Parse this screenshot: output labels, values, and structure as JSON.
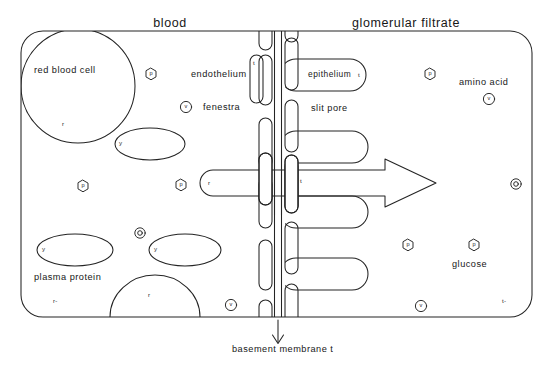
{
  "figure": {
    "type": "biological-diagram",
    "background_color": "#ffffff",
    "line_color": "#222222"
  },
  "titles": {
    "left": "blood",
    "right": "glomerular  filtrate"
  },
  "annotations": {
    "red_blood_cell": "red  blood  cell",
    "endothelium": "endothelium",
    "fenestra": "fenestra",
    "epithelium": "epithelium",
    "slit_pore": "slit  pore",
    "amino_acid": "amino  acid",
    "plasma_protein": "plasma  protein",
    "glucose": "glucose",
    "basement_membrane": "basement  membrane  t"
  },
  "markers": {
    "rbc_label": "r",
    "dome_label": "r",
    "arrow_label": "r",
    "membrane_label": "t",
    "endothelium_cell_label": "t",
    "epithelium_cell_label": "t",
    "bottom_left": "r-",
    "bottom_right": "t-"
  },
  "molecules": [
    {
      "symbol": "p",
      "shape": "hexagon",
      "x": 151,
      "y": 74
    },
    {
      "symbol": "v",
      "shape": "circle",
      "x": 186,
      "y": 107
    },
    {
      "symbol": "p",
      "shape": "hexagon",
      "x": 83,
      "y": 186
    },
    {
      "symbol": "p",
      "shape": "hexagon",
      "x": 181,
      "y": 185
    },
    {
      "symbol": "e",
      "shape": "ring",
      "x": 140,
      "y": 233
    },
    {
      "symbol": "v",
      "shape": "circle",
      "x": 231,
      "y": 305
    },
    {
      "symbol": "p",
      "shape": "hexagon",
      "x": 430,
      "y": 74
    },
    {
      "symbol": "v",
      "shape": "circle",
      "x": 489,
      "y": 99
    },
    {
      "symbol": "e",
      "shape": "ring",
      "x": 516,
      "y": 184
    },
    {
      "symbol": "p",
      "shape": "hexagon",
      "x": 408,
      "y": 245
    },
    {
      "symbol": "p",
      "shape": "hexagon",
      "x": 474,
      "y": 245
    },
    {
      "symbol": "v",
      "shape": "circle",
      "x": 421,
      "y": 306
    }
  ],
  "plasma_proteins": [
    {
      "label": "y",
      "cx": 150,
      "cy": 144,
      "rx": 35,
      "ry": 16
    },
    {
      "label": "y",
      "cx": 75,
      "cy": 250,
      "rx": 38,
      "ry": 16
    },
    {
      "label": "y",
      "cx": 185,
      "cy": 250,
      "rx": 36,
      "ry": 16
    }
  ],
  "arrow": {
    "label": "r",
    "description": "filtration flow arrow crossing the barrier",
    "start_x": 200,
    "tip_x": 436,
    "center_y": 183
  }
}
